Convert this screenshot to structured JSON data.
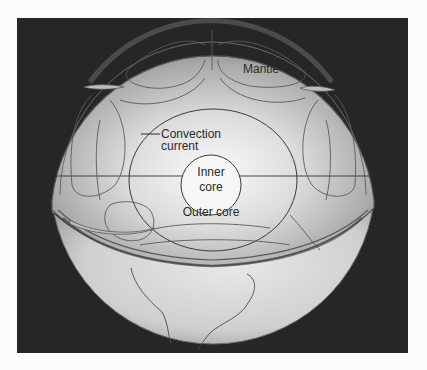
{
  "figure": {
    "background_color": "#262626",
    "labels": {
      "mantle": "Mantle",
      "convection_line1": "Convection",
      "convection_line2": "current",
      "inner_core_line1": "Inner",
      "inner_core_line2": "core",
      "outer_core": "Outer core"
    }
  }
}
